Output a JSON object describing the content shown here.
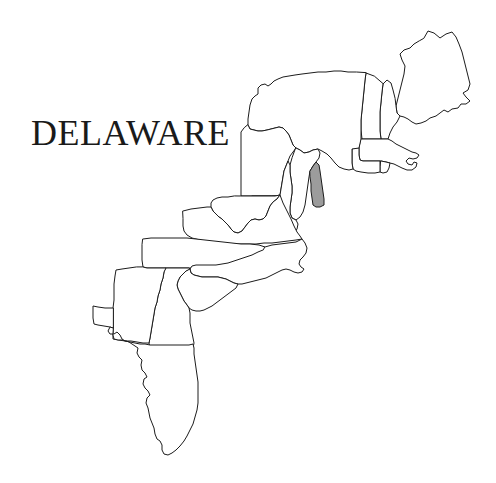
{
  "page": {
    "background_color": "#ffffff",
    "width": 496,
    "height": 483
  },
  "title": {
    "text": "DELAWARE",
    "color": "#1a1a1a"
  },
  "map": {
    "name": "eastern-united-states-outline-map",
    "outline_color": "#1c1c1c",
    "fill_color": "#ffffff",
    "highlight_color": "#9c9c9c",
    "highlighted_state": "Delaware",
    "states": [
      {
        "id": "maine",
        "label": "Maine",
        "highlighted": false
      },
      {
        "id": "new-hampshire",
        "label": "New Hampshire",
        "highlighted": false
      },
      {
        "id": "vermont",
        "label": "Vermont",
        "highlighted": false
      },
      {
        "id": "massachusetts",
        "label": "Massachusetts",
        "highlighted": false
      },
      {
        "id": "rhode-island",
        "label": "Rhode Island",
        "highlighted": false
      },
      {
        "id": "connecticut",
        "label": "Connecticut",
        "highlighted": false
      },
      {
        "id": "new-york",
        "label": "New York",
        "highlighted": false
      },
      {
        "id": "new-jersey",
        "label": "New Jersey",
        "highlighted": false
      },
      {
        "id": "pennsylvania",
        "label": "Pennsylvania",
        "highlighted": false
      },
      {
        "id": "delaware",
        "label": "Delaware",
        "highlighted": true
      },
      {
        "id": "maryland",
        "label": "Maryland",
        "highlighted": false
      },
      {
        "id": "virginia",
        "label": "Virginia",
        "highlighted": false
      },
      {
        "id": "west-virginia",
        "label": "West Virginia",
        "highlighted": false
      },
      {
        "id": "north-carolina",
        "label": "North Carolina",
        "highlighted": false
      },
      {
        "id": "south-carolina",
        "label": "South Carolina",
        "highlighted": false
      },
      {
        "id": "georgia",
        "label": "Georgia",
        "highlighted": false
      },
      {
        "id": "florida",
        "label": "Florida",
        "highlighted": false
      },
      {
        "id": "alabama",
        "label": "Alabama",
        "highlighted": false
      },
      {
        "id": "tennessee",
        "label": "Tennessee",
        "highlighted": false
      }
    ]
  }
}
